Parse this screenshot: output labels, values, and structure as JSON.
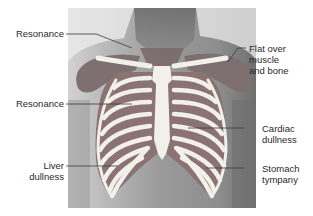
{
  "figure": {
    "colors": {
      "background": "#ffffff",
      "skin_light": "#c9c9c9",
      "skin_mid": "#a9a9a9",
      "skin_dark": "#7d7d7d",
      "overlay": "#8a7070",
      "overlay_dark": "#7a5f60",
      "bone": "#f2f0ea",
      "leader_line": "#3a3a3a",
      "text": "#2a2a2a"
    },
    "labels": [
      {
        "id": "resonance-upper",
        "lines": [
          "Resonance"
        ],
        "side": "left"
      },
      {
        "id": "flat-over-muscle-bone",
        "lines": [
          "Flat over",
          "muscle",
          "and bone"
        ],
        "side": "right"
      },
      {
        "id": "resonance-mid",
        "lines": [
          "Resonance"
        ],
        "side": "left"
      },
      {
        "id": "cardiac-dullness",
        "lines": [
          "Cardiac",
          "dullness"
        ],
        "side": "right"
      },
      {
        "id": "liver-dullness",
        "lines": [
          "Liver",
          "dullness"
        ],
        "side": "left"
      },
      {
        "id": "stomach-tympany",
        "lines": [
          "Stomach",
          "tympany"
        ],
        "side": "right"
      }
    ]
  }
}
